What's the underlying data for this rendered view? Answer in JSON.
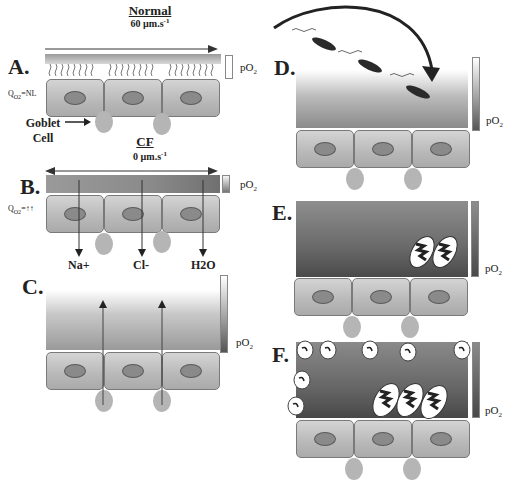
{
  "panels": {
    "A": {
      "label": "A.",
      "flow_title": "Normal",
      "flow_rate": "60 µm.s",
      "flow_rate_exp": "-1",
      "qo2": "Q",
      "qo2_sub": "O2",
      "qo2_value": "=NL",
      "po2": "pO",
      "po2_sub": "2",
      "goblet_label_1": "Goblet",
      "goblet_label_2": "Cell"
    },
    "B": {
      "label": "B.",
      "flow_title": "CF",
      "flow_rate": "0 µm.s",
      "flow_rate_exp": "-1",
      "qo2": "Q",
      "qo2_sub": "O2",
      "qo2_value": "=↑↑",
      "po2": "pO",
      "po2_sub": "2",
      "ions": [
        "Na+",
        "Cl-",
        "H2O"
      ]
    },
    "C": {
      "label": "C.",
      "po2": "pO",
      "po2_sub": "2"
    },
    "D": {
      "label": "D.",
      "po2": "pO",
      "po2_sub": "2"
    },
    "E": {
      "label": "E.",
      "po2": "pO",
      "po2_sub": "2"
    },
    "F": {
      "label": "F.",
      "po2": "pO",
      "po2_sub": "2"
    }
  },
  "colors": {
    "mucus_dark": "#4a4a4a",
    "mucus_light": "#f2f2f2",
    "cell": "#bdbdbd",
    "nucleus": "#8a8a8a",
    "bacteria": "#2a2a2a"
  }
}
